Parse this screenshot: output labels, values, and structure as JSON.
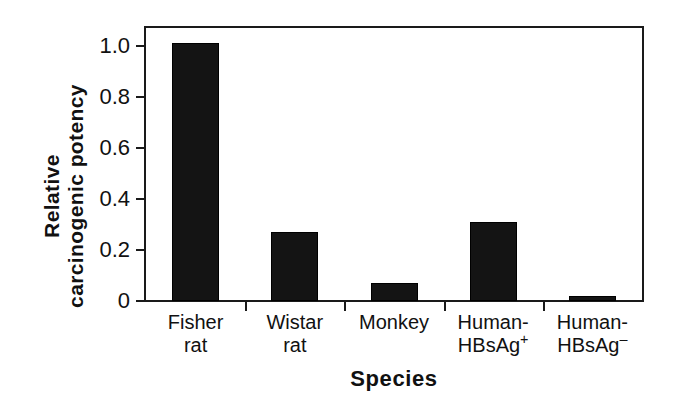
{
  "chart_data": {
    "type": "bar",
    "title": "",
    "xlabel": "Species",
    "ylabel_line1": "Relative",
    "ylabel_line2": "carcinogenic potency",
    "categories": [
      "Fisher rat",
      "Wistar rat",
      "Monkey",
      "Human-HBsAg+",
      "Human-HBsAg-"
    ],
    "category_labels": [
      {
        "line1": "Fisher",
        "line2": "rat",
        "sup": ""
      },
      {
        "line1": "Wistar",
        "line2": "rat",
        "sup": ""
      },
      {
        "line1": "Monkey",
        "line2": "",
        "sup": ""
      },
      {
        "line1": "Human-",
        "line2": "HBsAg",
        "sup": "+"
      },
      {
        "line1": "Human-",
        "line2": "HBsAg",
        "sup": "–"
      }
    ],
    "values": [
      1.01,
      0.27,
      0.07,
      0.31,
      0.02
    ],
    "ylim": [
      0,
      1.07
    ],
    "yticks": [
      0,
      0.2,
      0.4,
      0.6,
      0.8,
      1.0
    ],
    "ytick_labels": [
      "0",
      "0.2",
      "0.4",
      "0.6",
      "0.8",
      "1.0"
    ],
    "grid": false,
    "legend": false,
    "bar_color": "#141414",
    "axis_color": "#1a1a1a",
    "background": "#ffffff"
  }
}
